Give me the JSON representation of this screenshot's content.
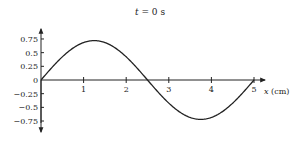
{
  "chart_data": {
    "type": "line",
    "title": "t = 0 s",
    "title_var": "t",
    "title_rest": " = 0 s",
    "xlabel": "x (cm)",
    "xlabel_var": "x",
    "xlabel_rest": " (cm)",
    "ylabel": "",
    "xlim": [
      0,
      5
    ],
    "ylim": [
      -0.75,
      0.75
    ],
    "x_ticks": [
      1,
      2,
      3,
      4,
      5
    ],
    "x_tick_labels": [
      "1",
      "2",
      "3",
      "4",
      "5"
    ],
    "y_ticks": [
      0.75,
      0.5,
      0.25,
      0,
      -0.25,
      -0.5,
      -0.75
    ],
    "y_tick_labels": [
      "0.75",
      "0.5",
      "0.25",
      "0",
      "−0.25",
      "−0.5",
      "−0.75"
    ],
    "grid": false,
    "legend": null,
    "series": [
      {
        "name": "wave at t = 0 s",
        "function": "y = 0.72 sin(2πx/5)",
        "amplitude": 0.72,
        "wavelength_cm": 5,
        "x": [
          0,
          0.25,
          0.5,
          0.75,
          1,
          1.25,
          1.5,
          1.75,
          2,
          2.25,
          2.5,
          2.75,
          3,
          3.25,
          3.5,
          3.75,
          4,
          4.25,
          4.5,
          4.75,
          5
        ],
        "values": [
          0,
          0.22,
          0.42,
          0.58,
          0.68,
          0.72,
          0.68,
          0.58,
          0.42,
          0.22,
          0,
          -0.22,
          -0.42,
          -0.58,
          -0.68,
          -0.72,
          -0.68,
          -0.58,
          -0.42,
          -0.22,
          0
        ]
      }
    ],
    "colors": {
      "line": "#222222",
      "axis": "#222222"
    }
  },
  "layout": {
    "origin_px": [
      41,
      80
    ],
    "x_unit_px": 42.6,
    "y_unit_px": 54.7
  }
}
